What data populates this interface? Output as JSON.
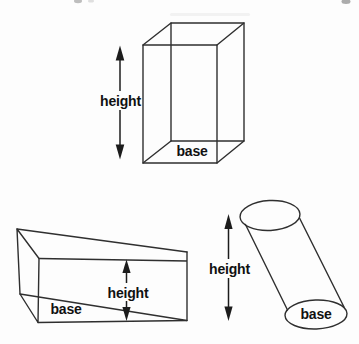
{
  "page": {
    "background_color": "#fdfdfd",
    "line_color": "#2f2f2f",
    "text_color": "#111111"
  },
  "figures": {
    "rectangular_prism": {
      "height_label": "height",
      "base_label": "base"
    },
    "triangular_prism": {
      "height_label": "height",
      "base_label": "base"
    },
    "oblique_cylinder": {
      "height_label": "height",
      "base_label": "base"
    }
  }
}
